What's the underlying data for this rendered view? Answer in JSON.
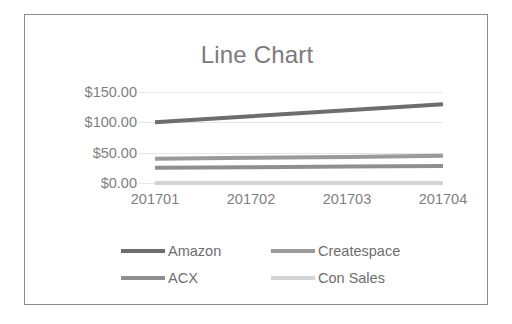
{
  "chart_data": {
    "type": "line",
    "title": "Line Chart",
    "xlabel": "",
    "ylabel": "",
    "grid": true,
    "legend_position": "bottom",
    "categories": [
      "201701",
      "201702",
      "201703",
      "201704"
    ],
    "ylim": [
      0,
      150
    ],
    "yticks": [
      0,
      50,
      100,
      150
    ],
    "ytick_labels": [
      "$0.00",
      "$50.00",
      "$100.00",
      "$150.00"
    ],
    "series": [
      {
        "name": "Amazon",
        "color": "#6d6d6d",
        "values": [
          100.0,
          110.0,
          120.0,
          130.0
        ]
      },
      {
        "name": "Createspace",
        "color": "#9a9a9a",
        "values": [
          40.0,
          41.5,
          43.0,
          45.0
        ]
      },
      {
        "name": "ACX",
        "color": "#8f8f8f",
        "values": [
          25.0,
          26.0,
          27.0,
          28.0
        ]
      },
      {
        "name": "Con Sales",
        "color": "#d4d4d4",
        "values": [
          0.0,
          0.0,
          0.0,
          0.0
        ]
      }
    ]
  },
  "chart": {
    "title": "Line Chart",
    "y_axis": {
      "ticks": [
        {
          "label": "$150.00",
          "value": 150
        },
        {
          "label": "$100.00",
          "value": 100
        },
        {
          "label": "$50.00",
          "value": 50
        },
        {
          "label": "$0.00",
          "value": 0
        }
      ]
    },
    "x_axis": {
      "ticks": [
        {
          "label": "201701"
        },
        {
          "label": "201702"
        },
        {
          "label": "201703"
        },
        {
          "label": "201704"
        }
      ]
    },
    "legend": {
      "items": [
        {
          "label": "Amazon",
          "color": "#6d6d6d"
        },
        {
          "label": "Createspace",
          "color": "#9a9a9a"
        },
        {
          "label": "ACX",
          "color": "#8f8f8f"
        },
        {
          "label": "Con Sales",
          "color": "#d4d4d4"
        }
      ]
    },
    "colors": {
      "gridline": "#e6e6e6",
      "border": "#8c8c8c",
      "title_text": "#7b7b7b",
      "tick_text": "#808080",
      "legend_text": "#6e6e6e",
      "background": "#ffffff"
    }
  }
}
